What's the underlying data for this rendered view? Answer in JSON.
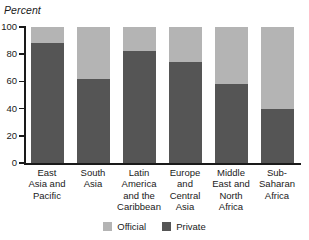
{
  "chart_data": {
    "type": "bar",
    "subtype": "stacked-100-percent",
    "title": "",
    "xlabel": "",
    "ylabel": "Percent",
    "ylim": [
      0,
      100
    ],
    "yticks": [
      0,
      20,
      40,
      60,
      80,
      100
    ],
    "grid": false,
    "legend_position": "bottom-center",
    "categories": [
      "East Asia and Pacific",
      "South Asia",
      "Latin America and the Caribbean",
      "Europe and Central Asia",
      "Middle East and North Africa",
      "Sub-Saharan Africa"
    ],
    "category_lines": [
      [
        "East",
        "Asia and",
        "Pacific"
      ],
      [
        "South",
        "Asia"
      ],
      [
        "Latin",
        "America",
        "and the",
        "Caribbean"
      ],
      [
        "Europe",
        "and",
        "Central",
        "Asia"
      ],
      [
        "Middle",
        "East and",
        "North",
        "Africa"
      ],
      [
        "Sub-",
        "Saharan",
        "Africa"
      ]
    ],
    "series": [
      {
        "name": "Private",
        "color": "#555555",
        "values": [
          88,
          62,
          82,
          74,
          58,
          40
        ]
      },
      {
        "name": "Official",
        "color": "#b4b4b4",
        "values": [
          12,
          38,
          18,
          26,
          42,
          60
        ]
      }
    ]
  },
  "axis": {
    "y_title": "Percent",
    "tick_labels": [
      "100",
      "80",
      "60",
      "40",
      "20",
      "0"
    ]
  },
  "legend": {
    "items": [
      {
        "label": "Official",
        "color": "#b4b4b4"
      },
      {
        "label": "Private",
        "color": "#555555"
      }
    ]
  },
  "colors": {
    "official": "#b4b4b4",
    "private": "#555555",
    "axis": "#1a1a1a",
    "background": "#ffffff"
  }
}
